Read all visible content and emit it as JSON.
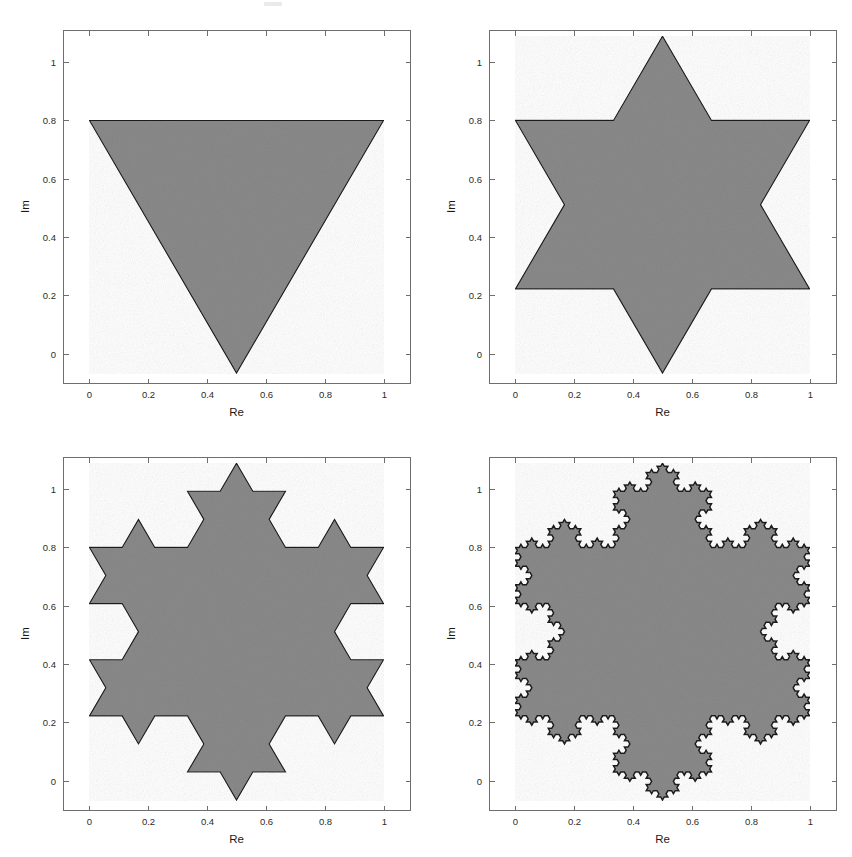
{
  "figure": {
    "layout": "2x2-grid",
    "width": 852,
    "height": 857,
    "background_color": "#ffffff"
  },
  "style": {
    "fill_color": "#8a8a8a",
    "edge_color": "#1c1c1c",
    "axis_color": "#6e6e6e",
    "text_color": "#2b2b2b"
  },
  "axes_common": {
    "xlabel": "Re",
    "ylabel": "Im",
    "xticks": [
      "0",
      "0.2",
      "0.4",
      "0.6",
      "0.8",
      "1"
    ],
    "xtick_values": [
      0,
      0.2,
      0.4,
      0.6,
      0.8,
      1
    ],
    "yticks": [
      "0",
      "0.2",
      "0.4",
      "0.6",
      "0.8",
      "1"
    ],
    "ytick_values": [
      0,
      0.2,
      0.4,
      0.6,
      0.8,
      1
    ],
    "xlim": [
      -0.09,
      1.09
    ],
    "ylim": [
      -0.1,
      1.11
    ],
    "grid": false,
    "box": true
  },
  "chart_data": [
    {
      "type": "line",
      "panel": "top-left",
      "title": "",
      "xlabel": "Re",
      "ylabel": "Im",
      "xticks": [
        "0",
        "0.2",
        "0.4",
        "0.6",
        "0.8",
        "1"
      ],
      "yticks": [
        "0",
        "0.2",
        "0.4",
        "0.6",
        "0.8",
        "1"
      ],
      "xlim": [
        -0.09,
        1.09
      ],
      "ylim": [
        -0.1,
        1.11
      ],
      "grid": false,
      "shape": "koch-snowflake",
      "iteration": 0,
      "description": "Downward-pointing equilateral triangle (Koch snowflake generator, level 0)",
      "vertices": [
        [
          0,
          0.8
        ],
        [
          1,
          0.8
        ],
        [
          0.5,
          -0.0660254
        ]
      ],
      "fill": "#8a8a8a",
      "edge": "#1c1c1c",
      "segments": 3,
      "y_top": 0.8,
      "y_bottom": -0.0660254
    },
    {
      "type": "line",
      "panel": "top-right",
      "title": "",
      "xlabel": "Re",
      "ylabel": "Im",
      "xticks": [
        "0",
        "0.2",
        "0.4",
        "0.6",
        "0.8",
        "1"
      ],
      "yticks": [
        "0",
        "0.2",
        "0.4",
        "0.6",
        "0.8",
        "1"
      ],
      "xlim": [
        -0.09,
        1.09
      ],
      "ylim": [
        -0.1,
        1.11
      ],
      "grid": false,
      "shape": "koch-snowflake",
      "iteration": 1,
      "description": "Six-pointed star (Star of David), Koch snowflake level 1",
      "fill": "#8a8a8a",
      "edge": "#1c1c1c",
      "segments": 12,
      "y_top": 1.0773503,
      "y_bottom": -0.0660254
    },
    {
      "type": "line",
      "panel": "bottom-left",
      "title": "",
      "xlabel": "Re",
      "ylabel": "Im",
      "xticks": [
        "0",
        "0.2",
        "0.4",
        "0.6",
        "0.8",
        "1"
      ],
      "yticks": [
        "0",
        "0.2",
        "0.4",
        "0.6",
        "0.8",
        "1"
      ],
      "xlim": [
        -0.09,
        1.09
      ],
      "ylim": [
        -0.1,
        1.11
      ],
      "grid": false,
      "shape": "koch-snowflake",
      "iteration": 2,
      "description": "Koch snowflake level 2, 48 boundary segments",
      "fill": "#8a8a8a",
      "edge": "#1c1c1c",
      "segments": 48,
      "y_top": 1.0773503,
      "y_bottom": -0.0660254
    },
    {
      "type": "line",
      "panel": "bottom-right",
      "title": "",
      "xlabel": "Re",
      "ylabel": "Im",
      "xticks": [
        "0",
        "0.2",
        "0.4",
        "0.6",
        "0.8",
        "1"
      ],
      "yticks": [
        "0",
        "0.2",
        "0.4",
        "0.6",
        "0.8",
        "1"
      ],
      "xlim": [
        -0.09,
        1.09
      ],
      "ylim": [
        -0.1,
        1.11
      ],
      "grid": false,
      "shape": "koch-snowflake",
      "iteration": 4,
      "description": "Koch snowflake level 4, 768 boundary segments",
      "fill": "#8a8a8a",
      "edge": "#1c1c1c",
      "segments": 768,
      "y_top": 1.0773503,
      "y_bottom": -0.0660254
    }
  ]
}
